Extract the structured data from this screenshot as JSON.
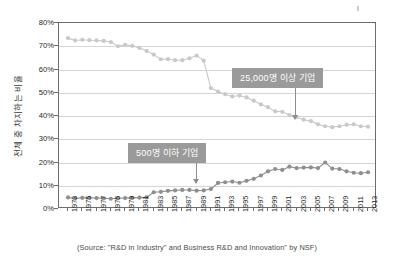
{
  "axes": {
    "y_title": "전체 중 차지하는 비율",
    "y_ticks": [
      "0%",
      "10%",
      "20%",
      "30%",
      "40%",
      "50%",
      "60%",
      "70%",
      "80%"
    ],
    "x_ticks": [
      "1973",
      "1975",
      "1977",
      "1975",
      "1979",
      "1981",
      "1983",
      "1985",
      "1987",
      "1989",
      "1991",
      "1993",
      "1995",
      "1997",
      "1999",
      "2001",
      "2003",
      "2005",
      "2007",
      "2009",
      "2011",
      "2013",
      "2015"
    ]
  },
  "annotations": {
    "large_firms": "25,000명 이상 기업",
    "small_firms": "500명 이하 기업"
  },
  "source": "(Source: \"R&D in Industry\" and Business R&D and Innovation\" by NSF)",
  "colors": {
    "large_firms_series": "#c9c9c9",
    "small_firms_series": "#8f8f8f",
    "callout_background": "#9a9a9a",
    "callout_text": "#ffffff",
    "axis": "#6d6d6d",
    "grid": "#d5d5d5"
  },
  "chart_data": {
    "type": "line",
    "title": "",
    "xlabel": "",
    "ylabel": "전체 중 차지하는 비율",
    "ylim": [
      0,
      80
    ],
    "xlim": [
      1973,
      2015
    ],
    "ytick_step": 10,
    "grid": true,
    "legend": "annotated callouts (no legend box)",
    "x": [
      1973,
      1974,
      1975,
      1976,
      1977,
      1978,
      1979,
      1980,
      1981,
      1982,
      1983,
      1984,
      1985,
      1986,
      1987,
      1988,
      1989,
      1990,
      1991,
      1992,
      1993,
      1994,
      1995,
      1996,
      1997,
      1998,
      1999,
      2000,
      2001,
      2002,
      2003,
      2004,
      2005,
      2006,
      2007,
      2008,
      2009,
      2010,
      2011,
      2012,
      2013,
      2014,
      2015
    ],
    "series": [
      {
        "name": "25,000명 이상 기업",
        "color": "#c9c9c9",
        "values": [
          73.5,
          72.5,
          72.8,
          72.6,
          72.5,
          72.3,
          71.8,
          70.0,
          70.6,
          70.2,
          69.3,
          68.0,
          66.4,
          64.4,
          64.5,
          64.0,
          64.0,
          64.8,
          66.0,
          63.8,
          52.0,
          50.5,
          49.4,
          48.4,
          48.8,
          48.0,
          46.6,
          45.0,
          43.8,
          42.0,
          41.8,
          40.4,
          39.6,
          38.4,
          37.8,
          36.4,
          35.6,
          35.2,
          35.6,
          36.2,
          36.4,
          35.6,
          35.4
        ]
      },
      {
        "name": "500명 이하 기업",
        "color": "#8f8f8f",
        "values": [
          5.0,
          4.5,
          4.8,
          4.8,
          4.7,
          4.6,
          4.4,
          4.6,
          4.7,
          4.8,
          4.9,
          5.0,
          7.2,
          7.4,
          7.8,
          8.0,
          8.2,
          8.2,
          7.9,
          8.0,
          8.6,
          11.2,
          11.5,
          11.8,
          11.3,
          12.1,
          13.0,
          14.4,
          16.2,
          17.2,
          16.8,
          18.2,
          17.6,
          17.8,
          17.9,
          17.6,
          20.0,
          17.4,
          17.2,
          16.2,
          15.6,
          15.4,
          15.8
        ]
      }
    ]
  }
}
